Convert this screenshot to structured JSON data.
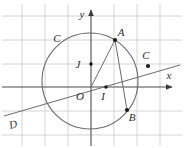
{
  "figure": {
    "kind": "geometry-diagram",
    "width": 184,
    "height": 148,
    "background_color": "#ffffff",
    "grid_color": "#c9c9cf",
    "axis_color": "#4a4a4a",
    "stroke_color": "#5a5a5a",
    "label_color": "#2b2b2b",
    "point_color": "#1a1a1a"
  },
  "axes": {
    "x_label": "x",
    "y_label": "y",
    "origin_label": "O",
    "x_axis_y": 87,
    "y_axis_x": 91,
    "grid_spacing": 23
  },
  "labels": {
    "curve_circle": "C",
    "line_d": "D"
  },
  "points": [
    {
      "name": "A",
      "label": "A",
      "x": 115,
      "y": 40,
      "label_dx": 6,
      "label_dy": -4,
      "marker": true
    },
    {
      "name": "B",
      "label": "B",
      "x": 127,
      "y": 110,
      "label_dx": 5,
      "label_dy": 11,
      "marker": true
    },
    {
      "name": "C",
      "label": "C",
      "x": 148,
      "y": 66,
      "label_dx": -2,
      "label_dy": -7,
      "marker": true
    },
    {
      "name": "I",
      "label": "I",
      "x": 106,
      "y": 87,
      "label_dx": -3,
      "label_dy": 13,
      "marker": true
    },
    {
      "name": "J",
      "label": "J",
      "x": 91,
      "y": 64,
      "label_dx": -13,
      "label_dy": 4,
      "marker": true
    },
    {
      "name": "O",
      "label": "O",
      "x": 91,
      "y": 87,
      "label_dx": -11,
      "label_dy": 13,
      "marker": false
    }
  ],
  "circle": {
    "name": "circle-C",
    "center_x": 90,
    "center_y": 81,
    "radius": 48
  },
  "line": {
    "name": "line-D",
    "x1": 4,
    "y1": 116,
    "x2": 180,
    "y2": 65
  },
  "chord": {
    "name": "chord-AB",
    "x1": 115,
    "y1": 40,
    "x2": 127,
    "y2": 110
  },
  "segment_oa": {
    "name": "segment-OA",
    "x1": 91,
    "y1": 87,
    "x2": 115,
    "y2": 40
  },
  "curve_label_positions": {
    "circle_label_x": 57,
    "circle_label_y": 38,
    "line_label_x": 13,
    "line_label_y": 124
  }
}
